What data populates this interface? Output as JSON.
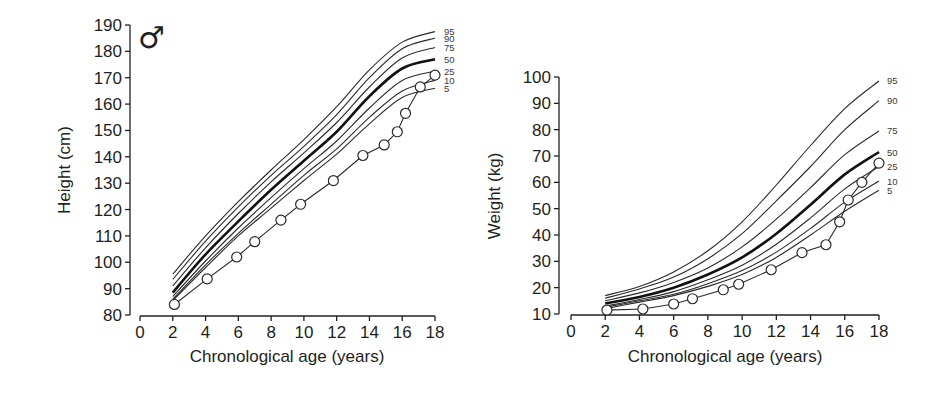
{
  "figure": {
    "sex_symbol": "♂"
  },
  "chart_data": [
    {
      "id": "height",
      "type": "line",
      "title": "",
      "xlabel": "Chronological age (years)",
      "ylabel": "Height (cm)",
      "xlim": [
        0,
        18
      ],
      "ylim": [
        80,
        190
      ],
      "xticks": [
        0,
        2,
        4,
        6,
        8,
        10,
        12,
        14,
        16,
        18
      ],
      "yticks": [
        80,
        90,
        100,
        110,
        120,
        130,
        140,
        150,
        160,
        170,
        180,
        190
      ],
      "grid": false,
      "legend": "percentile labels at right end of curves",
      "annotation": "♂",
      "percentile_curves": {
        "x": [
          2,
          4,
          6,
          8,
          10,
          12,
          14,
          16,
          18
        ],
        "series": [
          {
            "name": "95",
            "values": [
              95.5,
              110,
              123,
              135,
              146.5,
              159,
              173,
              183.5,
              187.5
            ]
          },
          {
            "name": "90",
            "values": [
              93.5,
              108,
              121,
              133,
              144,
              156,
              170,
              181,
              185
            ]
          },
          {
            "name": "75",
            "values": [
              91,
              105.5,
              118.5,
              130.5,
              141.5,
              153,
              166.5,
              177.5,
              181.5
            ]
          },
          {
            "name": "50",
            "values": [
              88.5,
              103,
              115.5,
              127.5,
              138.5,
              149.5,
              163,
              173.5,
              177
            ]
          },
          {
            "name": "25",
            "values": [
              87,
              100.5,
              113,
              124.5,
              135.5,
              146,
              158.5,
              169,
              172.5
            ]
          },
          {
            "name": "10",
            "values": [
              86,
              99,
              111,
              122,
              133,
              143,
              155,
              165,
              169
            ]
          },
          {
            "name": "5",
            "values": [
              85.5,
              98,
              110,
              120.5,
              131,
              141,
              152.5,
              162.5,
              166
            ]
          }
        ]
      },
      "patient": {
        "name": "Patient",
        "points": [
          [
            2.1,
            84
          ],
          [
            4.1,
            93.7
          ],
          [
            5.9,
            102
          ],
          [
            7.0,
            107.8
          ],
          [
            8.6,
            116
          ],
          [
            9.8,
            122
          ],
          [
            11.8,
            131
          ],
          [
            13.6,
            140.5
          ],
          [
            14.9,
            144.5
          ],
          [
            15.7,
            149.5
          ],
          [
            16.2,
            156.5
          ],
          [
            17.1,
            166.5
          ],
          [
            18.0,
            171
          ]
        ]
      }
    },
    {
      "id": "weight",
      "type": "line",
      "title": "",
      "xlabel": "Chronological age (years)",
      "ylabel": "Weight (kg)",
      "xlim": [
        0,
        18
      ],
      "ylim": [
        10,
        100
      ],
      "xticks": [
        0,
        2,
        4,
        6,
        8,
        10,
        12,
        14,
        16,
        18
      ],
      "yticks": [
        10,
        20,
        30,
        40,
        50,
        60,
        70,
        80,
        90,
        100
      ],
      "grid": false,
      "legend": "percentile labels at right end of curves",
      "percentile_curves": {
        "x": [
          2,
          4,
          6,
          8,
          10,
          12,
          14,
          16,
          18
        ],
        "series": [
          {
            "name": "95",
            "values": [
              17,
              20.5,
              26,
              34,
              45,
              59,
              74,
              88,
              98.5
            ]
          },
          {
            "name": "90",
            "values": [
              16,
              19.5,
              24,
              31,
              40.5,
              53,
              66,
              80,
              91
            ]
          },
          {
            "name": "75",
            "values": [
              15,
              18,
              22,
              27.5,
              35.5,
              46,
              58,
              70.5,
              79.5
            ]
          },
          {
            "name": "50",
            "values": [
              14,
              16.5,
              20,
              25,
              31.5,
              40.5,
              51.5,
              63,
              71.5
            ]
          },
          {
            "name": "25",
            "values": [
              13,
              15.5,
              18.5,
              23,
              28.5,
              36.5,
              46.5,
              57.5,
              66
            ]
          },
          {
            "name": "10",
            "values": [
              12.5,
              15,
              17.5,
              21.5,
              26.5,
              33.5,
              42.5,
              52.5,
              60.5
            ]
          },
          {
            "name": "5",
            "values": [
              12,
              14.5,
              17,
              20.5,
              25,
              31.5,
              40,
              49,
              57
            ]
          }
        ]
      },
      "patient": {
        "name": "Patient",
        "points": [
          [
            2.1,
            11.5
          ],
          [
            4.2,
            11.9
          ],
          [
            6.0,
            13.8
          ],
          [
            7.1,
            15.8
          ],
          [
            8.9,
            19.2
          ],
          [
            9.8,
            21.3
          ],
          [
            11.7,
            26.8
          ],
          [
            13.5,
            33.3
          ],
          [
            14.9,
            36.3
          ],
          [
            15.7,
            45
          ],
          [
            16.2,
            53.3
          ],
          [
            17.0,
            60
          ],
          [
            18.0,
            67.3
          ]
        ]
      }
    }
  ]
}
